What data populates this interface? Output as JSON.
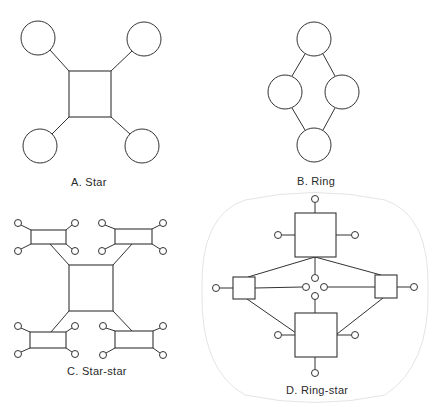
{
  "figure": {
    "stroke_color": "#333333",
    "boundary_color": "#e4e4e4",
    "background": "#ffffff"
  },
  "panels": [
    {
      "id": "A",
      "label": "A.  Star",
      "label_pos": [
        71,
        176
      ],
      "hub_rects": [
        [
          69,
          71,
          42,
          46
        ]
      ],
      "nodes_large": [
        [
          38,
          38,
          17
        ],
        [
          144,
          39,
          17
        ],
        [
          40,
          146,
          17
        ],
        [
          142,
          146,
          17
        ]
      ],
      "nodes_small": [],
      "lines": [
        [
          50,
          50,
          69,
          71
        ],
        [
          132,
          51,
          111,
          71
        ],
        [
          52,
          134,
          69,
          117
        ],
        [
          130,
          134,
          111,
          117
        ]
      ]
    },
    {
      "id": "B",
      "label": "B.  Ring",
      "label_pos": [
        297,
        175
      ],
      "hub_rects": [],
      "nodes_large": [
        [
          314,
          39,
          17
        ],
        [
          285,
          92,
          17
        ],
        [
          342,
          92,
          17
        ],
        [
          314,
          145,
          17
        ]
      ],
      "nodes_small": [],
      "lines": [
        [
          305,
          54,
          292,
          76
        ],
        [
          323,
          54,
          335,
          76
        ],
        [
          292,
          108,
          305,
          130
        ],
        [
          335,
          108,
          323,
          130
        ]
      ]
    },
    {
      "id": "C",
      "label": "C.  Star-star",
      "label_pos": [
        67,
        365
      ],
      "hub_rects": [
        [
          69,
          265,
          44,
          46
        ],
        [
          31,
          230,
          35,
          14
        ],
        [
          115,
          229,
          37,
          15
        ],
        [
          30,
          332,
          36,
          16
        ],
        [
          115,
          331,
          38,
          17
        ]
      ],
      "nodes_large": [],
      "nodes_small": [
        [
          18,
          223,
          3.5
        ],
        [
          75,
          223,
          3.5
        ],
        [
          18,
          251,
          3.5
        ],
        [
          75,
          251,
          3.5
        ],
        [
          102,
          223,
          3.5
        ],
        [
          163,
          223,
          3.5
        ],
        [
          102,
          251,
          3.5
        ],
        [
          163,
          251,
          3.5
        ],
        [
          18,
          326,
          3.5
        ],
        [
          75,
          326,
          3.5
        ],
        [
          18,
          354,
          3.5
        ],
        [
          75,
          354,
          3.5
        ],
        [
          103,
          326,
          3.5
        ],
        [
          163,
          326,
          3.5
        ],
        [
          103,
          355,
          3.5
        ],
        [
          163,
          355,
          3.5
        ]
      ],
      "lines": [
        [
          50,
          244,
          69,
          265
        ],
        [
          132,
          244,
          113,
          265
        ],
        [
          69,
          311,
          51,
          332
        ],
        [
          113,
          311,
          132,
          331
        ],
        [
          21,
          225,
          31,
          230
        ],
        [
          72,
          225,
          66,
          230
        ],
        [
          21,
          249,
          31,
          244
        ],
        [
          72,
          249,
          66,
          244
        ],
        [
          105,
          225,
          115,
          229
        ],
        [
          160,
          225,
          152,
          229
        ],
        [
          105,
          249,
          115,
          244
        ],
        [
          160,
          249,
          152,
          244
        ],
        [
          21,
          328,
          30,
          332
        ],
        [
          72,
          328,
          66,
          332
        ],
        [
          21,
          352,
          30,
          348
        ],
        [
          72,
          352,
          66,
          348
        ],
        [
          106,
          328,
          115,
          331
        ],
        [
          160,
          328,
          153,
          331
        ],
        [
          106,
          353,
          115,
          348
        ],
        [
          160,
          353,
          153,
          348
        ]
      ]
    },
    {
      "id": "D",
      "label": "D.  Ring-star",
      "label_pos": [
        286,
        384
      ],
      "hub_rects": [
        [
          295,
          213,
          41,
          44
        ],
        [
          233,
          277,
          22,
          22
        ],
        [
          375,
          275,
          22,
          23
        ],
        [
          295,
          313,
          42,
          44
        ]
      ],
      "nodes_large": [],
      "nodes_small": [
        [
          315,
          199,
          3.5
        ],
        [
          278,
          235,
          3.5
        ],
        [
          355,
          235,
          3.5
        ],
        [
          216,
          288,
          3.5
        ],
        [
          414,
          287,
          3.5
        ],
        [
          315,
          278,
          3.5
        ],
        [
          306,
          287,
          3.5
        ],
        [
          324,
          287,
          3.5
        ],
        [
          315,
          296,
          3.5
        ],
        [
          278,
          335,
          3.5
        ],
        [
          355,
          335,
          3.5
        ],
        [
          315,
          373,
          3.5
        ]
      ],
      "lines": [
        [
          315,
          203,
          315,
          213
        ],
        [
          282,
          235,
          295,
          235
        ],
        [
          336,
          235,
          351,
          235
        ],
        [
          315,
          257,
          315,
          274
        ],
        [
          315,
          299,
          315,
          313
        ],
        [
          220,
          288,
          233,
          288
        ],
        [
          397,
          287,
          410,
          287
        ],
        [
          255,
          288,
          302,
          287
        ],
        [
          328,
          287,
          375,
          287
        ],
        [
          315,
          257,
          248,
          277
        ],
        [
          315,
          257,
          381,
          275
        ],
        [
          247,
          299,
          296,
          333
        ],
        [
          383,
          298,
          337,
          334
        ],
        [
          282,
          335,
          295,
          335
        ],
        [
          337,
          335,
          351,
          335
        ],
        [
          315,
          357,
          315,
          369
        ]
      ],
      "boundary": "M 245 200 Q 315 185 385 200 Q 430 215 428 290 Q 430 365 385 395 Q 315 410 245 395 Q 200 370 202 290 Q 200 215 245 200 Z"
    }
  ]
}
